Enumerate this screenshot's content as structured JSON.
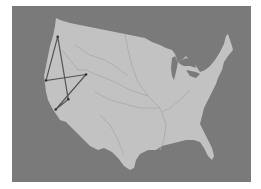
{
  "map": {
    "subject": "Contiguous United States",
    "background_color": "#7a7a7a",
    "land_color": "#c2c2c2",
    "river_color": "#a8a8a8",
    "route_color": "#555555",
    "route": {
      "points": [
        {
          "x": 57.7,
          "y": 36.7
        },
        {
          "x": 68.3,
          "y": 99.3
        },
        {
          "x": 55.7,
          "y": 109.5
        },
        {
          "x": 86.0,
          "y": 74.5
        },
        {
          "x": 46.0,
          "y": 80.5
        },
        {
          "x": 57.7,
          "y": 36.7
        }
      ]
    }
  }
}
